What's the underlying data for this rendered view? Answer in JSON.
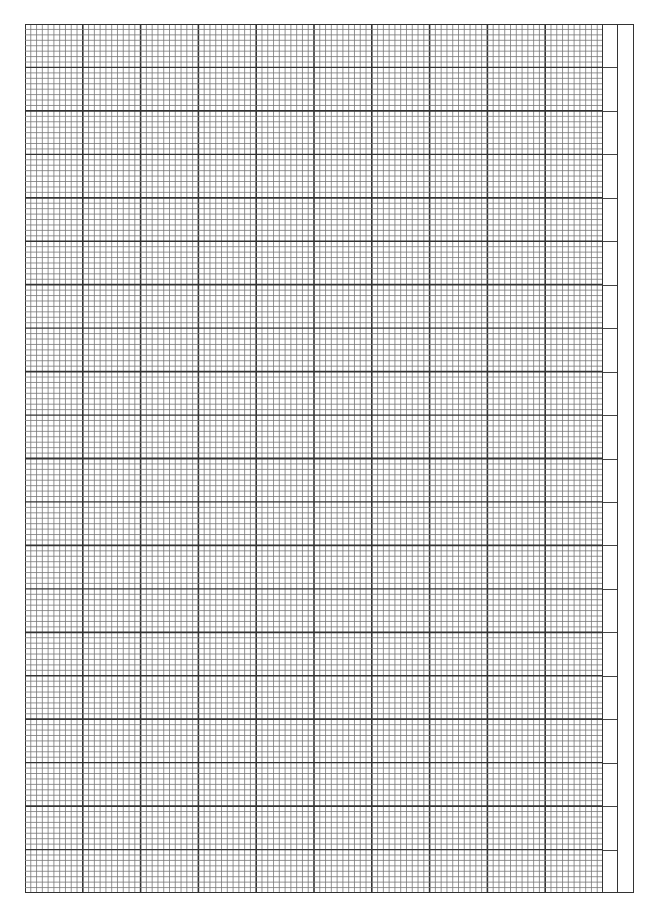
{
  "sheet": {
    "type": "graph-paper",
    "major_columns": 10,
    "minor_per_major_column": 10,
    "major_rows": 10,
    "minor_per_major_row": 16,
    "medium_per_major_row": 2,
    "side_strip_columns": 2,
    "side_strip_ticks": 20,
    "colors": {
      "line": "#333333",
      "minor_line": "#777777",
      "paper": "#ffffff"
    }
  }
}
